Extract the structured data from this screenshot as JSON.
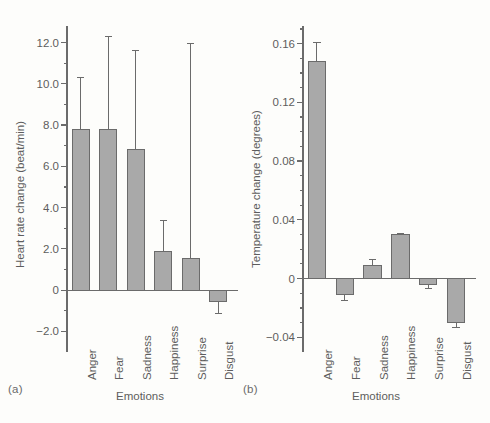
{
  "figure": {
    "background": "#fdfdfb",
    "bar_fill": "#a9a9a9",
    "bar_stroke": "#6b6b6b",
    "axis_color": "#6b6b6b",
    "text_color": "#5d5d5d"
  },
  "panels": [
    {
      "tag": "(a)",
      "ylabel": "Heart rate change (beat/min)",
      "xlabel": "Emotions"
    },
    {
      "tag": "(b)",
      "ylabel": "Temperature change (degrees)",
      "xlabel": "Emotions"
    }
  ],
  "chart_data": [
    {
      "type": "bar",
      "title": "",
      "panel": "(a)",
      "xlabel": "Emotions",
      "ylabel": "Heart rate change (beat/min)",
      "categories": [
        "Anger",
        "Fear",
        "Sadness",
        "Happiness",
        "Surprise",
        "Disgust"
      ],
      "values": [
        7.8,
        7.8,
        6.8,
        1.85,
        1.55,
        -0.55
      ],
      "errors_upper": [
        2.5,
        4.5,
        4.8,
        1.5,
        10.4,
        0.0
      ],
      "errors_lower": [
        0.0,
        0.0,
        0.0,
        0.0,
        0.0,
        0.6
      ],
      "error_type": "one-sided whisker away from zero",
      "ylim": [
        -3.0,
        12.8
      ],
      "ytick_labels": [
        "12.0",
        "10.0",
        "8.0",
        "6.0",
        "4.0",
        "2.0",
        "0",
        "-2.0"
      ],
      "ytick_values": [
        12.0,
        10.0,
        8.0,
        6.0,
        4.0,
        2.0,
        0,
        -2.0
      ],
      "yminor_step": 1.0,
      "grid": false,
      "legend": "none",
      "zero_line": true
    },
    {
      "type": "bar",
      "title": "",
      "panel": "(b)",
      "xlabel": "Emotions",
      "ylabel": "Temperature change (degrees)",
      "categories": [
        "Anger",
        "Fear",
        "Sadness",
        "Happiness",
        "Surprise",
        "Disgust"
      ],
      "values": [
        0.148,
        -0.011,
        0.009,
        0.03,
        -0.004,
        -0.03
      ],
      "errors_upper": [
        0.013,
        0.0,
        0.004,
        0.001,
        0.0,
        0.0
      ],
      "errors_lower": [
        0.0,
        0.004,
        0.0,
        0.0,
        0.003,
        0.003
      ],
      "error_type": "one-sided whisker away from zero",
      "ylim": [
        -0.05,
        0.172
      ],
      "ytick_labels": [
        "0.16",
        "0.12",
        "0.08",
        "0.04",
        "0",
        "-0.04"
      ],
      "ytick_values": [
        0.16,
        0.12,
        0.08,
        0.04,
        0,
        -0.04
      ],
      "yminor_step": 0.01,
      "grid": false,
      "legend": "none",
      "zero_line": true
    }
  ]
}
